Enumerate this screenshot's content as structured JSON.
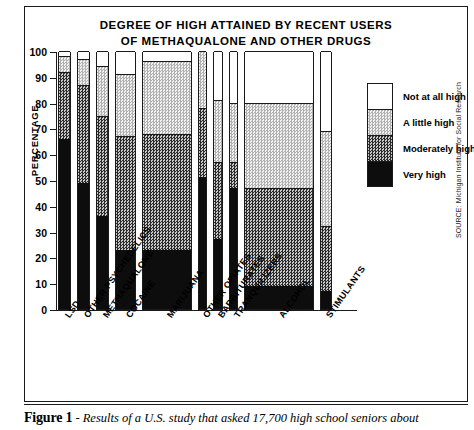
{
  "chart": {
    "title_line_1": "DEGREE OF HIGH ATTAINED BY RECENT USERS",
    "title_line_2": "OF METHAQUALONE AND OTHER DRUGS",
    "y_axis_title": "PERCENTAGE",
    "source_credit": "SOURCE: Michigan Institute for Social Research"
  },
  "legend": {
    "items": [
      {
        "label": "Not at all high",
        "key": "not_at_all_high",
        "color": "#ffffff"
      },
      {
        "label": "A little high",
        "key": "a_little_high",
        "color": "#dedede"
      },
      {
        "label": "Moderately high",
        "key": "moderately_high",
        "color": "#6e6e6e"
      },
      {
        "label": "Very high",
        "key": "very_high",
        "color": "#0d0d0d"
      }
    ]
  },
  "caption": {
    "figure_number": "Figure 1",
    "separator": " - ",
    "text": "Results of a U.S. study that asked 17,700 high school seniors about"
  },
  "chart_data": {
    "type": "bar",
    "title": "DEGREE OF HIGH ATTAINED BY RECENT USERS OF METHAQUALONE AND OTHER DRUGS",
    "xlabel": "",
    "ylabel": "PERCENTAGE",
    "ylim": [
      0,
      100
    ],
    "ytick_labels": [
      "0",
      "10",
      "20",
      "30",
      "40",
      "50",
      "60",
      "70",
      "80",
      "90",
      "100"
    ],
    "yticks": [
      0,
      10,
      20,
      30,
      40,
      50,
      60,
      70,
      80,
      90,
      100
    ],
    "grid": false,
    "stacked": true,
    "legend_position": "right",
    "categories": [
      "LSD",
      "OTHER PSYCHEDELICS",
      "METHAQUALONE",
      "COCAINE",
      "MARIJUANA",
      "OTHER OPIATES",
      "BARBITURATES",
      "TRANQUILIZERS",
      "ALCOHOL",
      "STIMULANTS"
    ],
    "series": [
      {
        "name": "Very high",
        "values": [
          66,
          49,
          36,
          23,
          23,
          51,
          27,
          47,
          9,
          7
        ]
      },
      {
        "name": "Moderately high",
        "values": [
          26,
          38,
          39,
          44,
          45,
          27,
          30,
          10,
          38,
          25
        ]
      },
      {
        "name": "A little high",
        "values": [
          6,
          10,
          19,
          24,
          28,
          22,
          24,
          23,
          33,
          37
        ]
      },
      {
        "name": "Not at all high",
        "values": [
          2,
          3,
          6,
          9,
          4,
          0,
          19,
          20,
          20,
          31
        ]
      }
    ],
    "cumulative_tops": {
      "very_high": [
        66,
        49,
        36,
        23,
        23,
        51,
        27,
        47,
        9,
        7
      ],
      "moderately_high": [
        92,
        87,
        75,
        67,
        68,
        78,
        57,
        57,
        47,
        32
      ],
      "a_little_high": [
        98,
        97,
        94,
        91,
        96,
        100,
        81,
        80,
        80,
        69
      ],
      "not_at_all_high": [
        100,
        100,
        100,
        100,
        100,
        100,
        100,
        100,
        100,
        100
      ]
    },
    "bar_geometry": [
      {
        "category": "LSD",
        "left": 0,
        "width": 13
      },
      {
        "category": "OTHER PSYCHEDELICS",
        "left": 19,
        "width": 13
      },
      {
        "category": "METHAQUALONE",
        "left": 38,
        "width": 13
      },
      {
        "category": "COCAINE",
        "left": 57,
        "width": 21
      },
      {
        "category": "MARIJUANA",
        "left": 84,
        "width": 50
      },
      {
        "category": "OTHER OPIATES",
        "left": 140,
        "width": 9
      },
      {
        "category": "BARBITURATES",
        "left": 155,
        "width": 10
      },
      {
        "category": "TRANQUILIZERS",
        "left": 171,
        "width": 9
      },
      {
        "category": "ALCOHOL",
        "left": 186,
        "width": 70
      },
      {
        "category": "STIMULANTS",
        "left": 262,
        "width": 12
      }
    ]
  }
}
